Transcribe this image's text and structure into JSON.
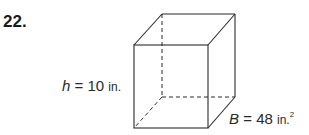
{
  "problem": {
    "number": "22."
  },
  "figure": {
    "shape": "rectangular prism",
    "height_label": {
      "variable": "h",
      "equals": "=",
      "value": "10",
      "unit": "in."
    },
    "base_label": {
      "variable": "B",
      "equals": "=",
      "value": "48",
      "unit": "in.",
      "exponent": "2"
    },
    "colors": {
      "line": "#2a2a2a",
      "background": "#ffffff"
    }
  }
}
